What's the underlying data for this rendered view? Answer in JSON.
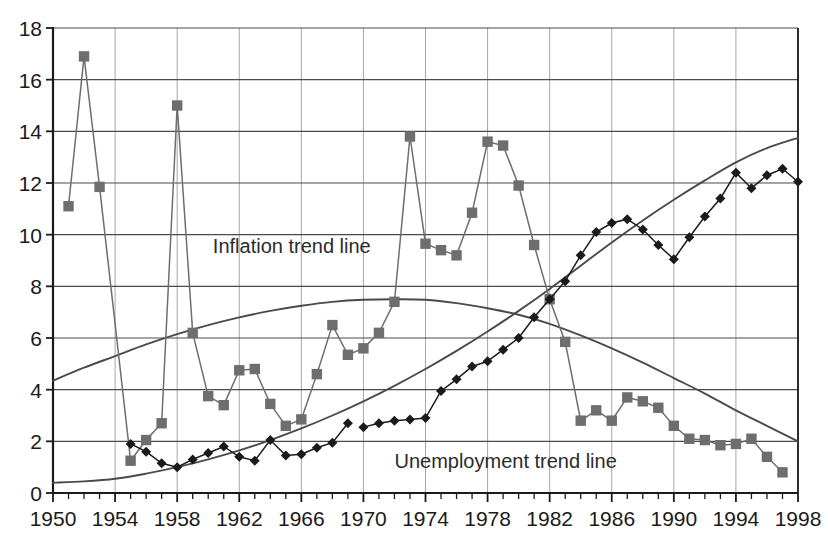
{
  "chart_data": {
    "type": "line",
    "title": "",
    "xlabel": "",
    "ylabel": "",
    "xlim": [
      1950,
      1998
    ],
    "ylim": [
      0,
      18
    ],
    "ytick_step": 2,
    "xtick_step": 1,
    "xticklabel_step": 4,
    "grid": "horizontal-and-minor-vertical",
    "legend": "inline-annotations",
    "yticklabels": [
      "0",
      "2",
      "4",
      "6",
      "8",
      "10",
      "12",
      "14",
      "16",
      "18"
    ],
    "xticklabels": [
      "1950",
      "1954",
      "1958",
      "1962",
      "1966",
      "1970",
      "1974",
      "1978",
      "1982",
      "1986",
      "1990",
      "1994",
      "1998"
    ],
    "annotations": [
      {
        "text": "Inflation trend line",
        "x": 1960.3,
        "y": 9.3
      },
      {
        "text": "Unemployment trend line",
        "x": 1972.0,
        "y": 0.95
      }
    ],
    "colors": {
      "inflation_series": "#6e6e6e",
      "unemployment_series": "#1a1a1a",
      "trend_line": "#4a4a4a",
      "axis": "#1a1a1a",
      "grid": "#4a4a4a",
      "background": "#ffffff"
    },
    "series": [
      {
        "name": "Inflation",
        "marker": "square",
        "color": "#6e6e6e",
        "x": [
          1951,
          1952,
          1953,
          1955,
          1956,
          1957,
          1958,
          1959,
          1960,
          1961,
          1962,
          1963,
          1964,
          1965,
          1966,
          1967,
          1968,
          1969,
          1970,
          1971,
          1972,
          1973,
          1974,
          1975,
          1976,
          1977,
          1978,
          1979,
          1980,
          1981,
          1982,
          1983,
          1984,
          1985,
          1986,
          1987,
          1988,
          1989,
          1990,
          1991,
          1992,
          1993,
          1994,
          1995,
          1996,
          1997
        ],
        "values": [
          11.1,
          16.9,
          11.85,
          1.25,
          2.05,
          2.7,
          15.0,
          6.2,
          3.75,
          3.4,
          4.75,
          4.8,
          3.45,
          2.6,
          2.85,
          4.6,
          6.5,
          5.35,
          5.6,
          6.2,
          7.4,
          13.8,
          9.65,
          9.4,
          9.2,
          10.85,
          13.6,
          13.45,
          11.9,
          9.6,
          7.5,
          5.85,
          2.8,
          3.2,
          2.8,
          3.7,
          3.55,
          3.3,
          2.6,
          2.1,
          2.05,
          1.85,
          1.9,
          2.1,
          1.4,
          0.8
        ]
      },
      {
        "name": "Unemployment",
        "marker": "diamond",
        "color": "#1a1a1a",
        "segments": [
          {
            "x": [
              1955,
              1956,
              1957,
              1958,
              1959,
              1960,
              1961,
              1962,
              1963,
              1964,
              1965,
              1966,
              1967,
              1968,
              1969
            ],
            "values": [
              1.9,
              1.6,
              1.15,
              1.0,
              1.3,
              1.55,
              1.8,
              1.4,
              1.25,
              2.05,
              1.45,
              1.5,
              1.75,
              1.95,
              2.7
            ]
          },
          {
            "x": [
              1970,
              1971,
              1972,
              1973,
              1974,
              1975,
              1976,
              1977,
              1978,
              1979,
              1980,
              1981,
              1982,
              1983,
              1984,
              1985,
              1986,
              1987,
              1988,
              1989,
              1990,
              1991,
              1992,
              1993,
              1994,
              1995,
              1996,
              1997,
              1998
            ],
            "values": [
              2.55,
              2.7,
              2.8,
              2.85,
              2.9,
              3.95,
              4.4,
              4.9,
              5.1,
              5.55,
              6.0,
              6.8,
              7.5,
              8.2,
              9.2,
              10.1,
              10.45,
              10.6,
              10.2,
              9.6,
              9.05,
              9.9,
              10.7,
              11.4,
              12.4,
              11.8,
              12.3,
              12.55,
              12.05
            ]
          }
        ]
      }
    ],
    "trend_lines": [
      {
        "name": "Inflation trend line",
        "color": "#4a4a4a",
        "x": [
          1950,
          1952,
          1954,
          1956,
          1958,
          1960,
          1962,
          1964,
          1966,
          1968,
          1970,
          1972,
          1974,
          1976,
          1978,
          1980,
          1982,
          1984,
          1986,
          1988,
          1990,
          1992,
          1994,
          1996,
          1998
        ],
        "values": [
          4.35,
          4.85,
          5.3,
          5.75,
          6.15,
          6.5,
          6.8,
          7.05,
          7.25,
          7.4,
          7.48,
          7.5,
          7.48,
          7.35,
          7.15,
          6.9,
          6.55,
          6.1,
          5.6,
          5.05,
          4.45,
          3.85,
          3.2,
          2.6,
          2.0
        ]
      },
      {
        "name": "Unemployment trend line",
        "color": "#4a4a4a",
        "x": [
          1950,
          1952,
          1954,
          1956,
          1958,
          1960,
          1962,
          1964,
          1966,
          1968,
          1970,
          1972,
          1974,
          1976,
          1978,
          1980,
          1982,
          1984,
          1986,
          1988,
          1990,
          1992,
          1994,
          1996,
          1998
        ],
        "values": [
          0.4,
          0.45,
          0.55,
          0.75,
          1.0,
          1.3,
          1.65,
          2.05,
          2.5,
          3.0,
          3.55,
          4.15,
          4.8,
          5.5,
          6.25,
          7.05,
          7.9,
          8.8,
          9.7,
          10.55,
          11.35,
          12.1,
          12.8,
          13.35,
          13.75
        ]
      }
    ]
  },
  "geometry": {
    "left": 53,
    "right": 798,
    "top": 28,
    "bottom": 493
  }
}
